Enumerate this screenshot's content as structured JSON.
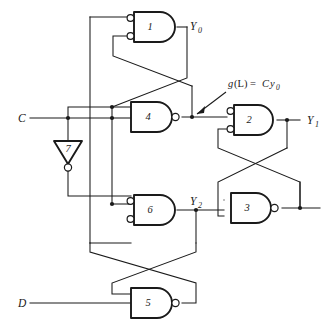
{
  "figure": {
    "kind": "logic-circuit-schematic",
    "title": "",
    "background_color": "#ffffff",
    "line_color": "#1a1a1a"
  },
  "inputs": [
    {
      "id": "C",
      "label": "C",
      "x": 18,
      "y": 118
    },
    {
      "id": "D",
      "label": "D",
      "x": 18,
      "y": 303
    }
  ],
  "outputs": [
    {
      "id": "Y0",
      "base": "Y",
      "sub": "0",
      "x": 190,
      "y": 26
    },
    {
      "id": "Y1",
      "base": "Y",
      "sub": "1",
      "x": 307,
      "y": 120
    },
    {
      "id": "Y2",
      "base": "Y",
      "sub": "2",
      "x": 190,
      "y": 203
    }
  ],
  "annotations": [
    {
      "id": "g-of-L",
      "text": "g(L) = Cy0",
      "parts": {
        "g": "g",
        "paren_l": "(L)",
        "equals": " = ",
        "c": "C",
        "y": "y",
        "sub": "0"
      },
      "x": 228,
      "y": 86,
      "points_to": "gate-4-output-node"
    }
  ],
  "gates": [
    {
      "id": "gate1",
      "number": "1",
      "type": "negative-input-and",
      "inputs_inverted": true,
      "output_inverted": false,
      "cx": 152,
      "cy": 27
    },
    {
      "id": "gate2",
      "number": "2",
      "type": "negative-input-and",
      "inputs_inverted": true,
      "output_inverted": false,
      "cx": 252,
      "cy": 120
    },
    {
      "id": "gate3",
      "number": "3",
      "type": "nand",
      "inputs_inverted": false,
      "output_inverted": true,
      "cx": 252,
      "cy": 208
    },
    {
      "id": "gate4",
      "number": "4",
      "type": "nand",
      "inputs_inverted": false,
      "output_inverted": true,
      "cx": 152,
      "cy": 117
    },
    {
      "id": "gate5",
      "number": "5",
      "type": "nand",
      "inputs_inverted": false,
      "output_inverted": true,
      "cx": 152,
      "cy": 303
    },
    {
      "id": "gate6",
      "number": "6",
      "type": "negative-input-and",
      "inputs_inverted": true,
      "output_inverted": false,
      "cx": 152,
      "cy": 210
    },
    {
      "id": "gate7",
      "number": "7",
      "type": "inverter",
      "orientation": "down",
      "inputs_inverted": false,
      "output_inverted": true,
      "cx": 68,
      "cy": 156
    }
  ],
  "junction_count": 8
}
